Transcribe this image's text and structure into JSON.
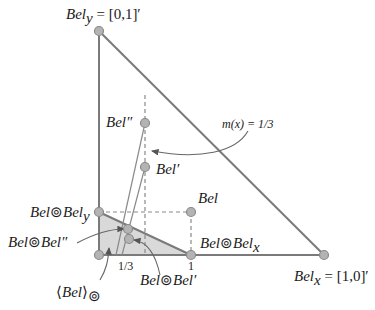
{
  "diagram": {
    "labels": {
      "bel_y": {
        "main": "Bel",
        "sub": "y",
        "rest": " = [0,1]′"
      },
      "bel_x": {
        "main": "Bel",
        "sub": "x",
        "rest": " = [1,0]′"
      },
      "bel": "Bel",
      "bel_prime": "Bel′",
      "bel_dprime": "Bel″",
      "annotation": "m(x) = 1/3",
      "bel_oplus_bel_y": {
        "a": "Bel",
        "op": "⊚",
        "b": "Bel",
        "sub": "y"
      },
      "bel_oplus_bel_x": {
        "a": "Bel",
        "op": "⊚",
        "b": "Bel",
        "sub": "x"
      },
      "bel_oplus_bel_dprime": {
        "a": "Bel",
        "op": "⊚",
        "b": "Bel″"
      },
      "bel_oplus_bel_prime": {
        "a": "Bel",
        "op": "⊚",
        "b": "Bel′"
      },
      "conditional_subspace": {
        "open": "⟨",
        "main": "Bel",
        "close": "⟩",
        "sub": "⊚"
      },
      "tick_third": "1/3",
      "tick_one": "1"
    },
    "colors": {
      "line": "#7a7a7a",
      "point_fill": "#b3b3b3",
      "region_fill": "#d9d9d9",
      "text": "#1a1a1a"
    }
  }
}
